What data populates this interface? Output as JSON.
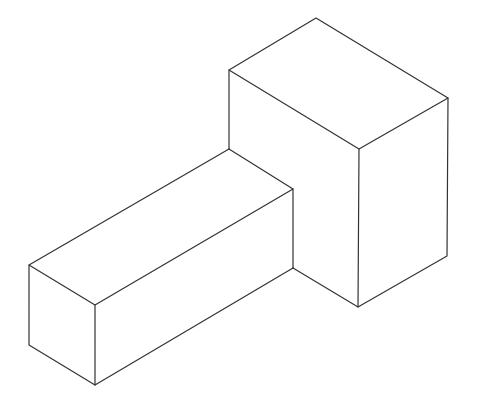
{
  "diagram": {
    "title": "",
    "colors": {
      "background": "#ffffff",
      "stroke": "#333333"
    },
    "tall_box": {
      "top": [
        316,
        18
      ],
      "left_top": [
        229,
        70
      ],
      "front_top": [
        359,
        149
      ],
      "right_top": [
        448,
        98
      ],
      "front_bottom": [
        358,
        307
      ],
      "right_bottom": [
        447,
        256
      ],
      "left_join": [
        229,
        149
      ]
    },
    "long_box": {
      "back_top": [
        229,
        149
      ],
      "front_right_top": [
        293,
        189
      ],
      "right_bottom": [
        293,
        268
      ],
      "left_top": [
        29,
        265
      ],
      "front_top": [
        95,
        305
      ],
      "left_bottom": [
        29,
        345
      ],
      "front_bottom": [
        95,
        385
      ]
    }
  }
}
